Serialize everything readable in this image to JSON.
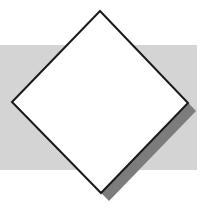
{
  "figure": {
    "title": "White diamond over grey horizontal band with drop shadow",
    "canvas": {
      "width": 205,
      "height": 219,
      "background_color": "#ffffff"
    },
    "background_band": {
      "label": "grey-band",
      "color": "#d4d4d4",
      "x": 0,
      "y": 45,
      "width": 197,
      "height": 125
    },
    "shadow": {
      "label": "diamond-drop-shadow",
      "color": "#7c7c7c",
      "offset_x": 8,
      "offset_y": 8,
      "points": "100,11 188,103 101,193 12,102"
    },
    "diamond": {
      "label": "diamond",
      "fill_color": "#ffffff",
      "stroke_color": "#1a1a1a",
      "stroke_width": 2,
      "points": "100,11 188,103 101,193 12,102",
      "vertices": {
        "top": {
          "x": 100,
          "y": 11
        },
        "right": {
          "x": 188,
          "y": 103
        },
        "bottom": {
          "x": 101,
          "y": 193
        },
        "left": {
          "x": 12,
          "y": 102
        }
      }
    }
  }
}
